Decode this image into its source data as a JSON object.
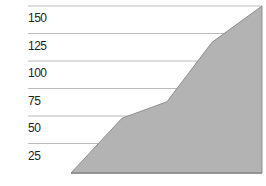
{
  "chart_data": {
    "type": "area",
    "title": "",
    "xlabel": "",
    "ylabel": "",
    "ylim": [
      0,
      150
    ],
    "yticks": [
      25,
      50,
      75,
      100,
      125,
      150
    ],
    "grid": true,
    "legend": null,
    "x": [
      0,
      1,
      2,
      3,
      4
    ],
    "series": [
      {
        "name": "",
        "values": [
          0,
          48,
          63,
          117,
          150
        ]
      }
    ],
    "colors": {
      "fill": "#b3b3b3",
      "stroke": "#8f8f8f",
      "grid": "#bbbbbb",
      "text": "#222222"
    }
  },
  "axis": {
    "tick_labels": [
      "150",
      "125",
      "100",
      "75",
      "50",
      "25"
    ]
  }
}
